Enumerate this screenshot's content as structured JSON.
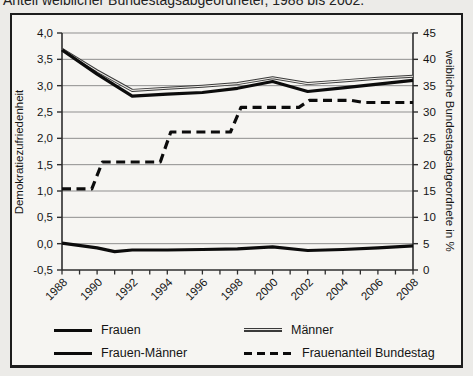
{
  "page": {
    "title": "Anteil weiblicher Bundestagsabgeordneter, 1988 bis 2002."
  },
  "chart_data": {
    "type": "line",
    "title": "Anteil weiblicher Bundestagsabgeordneter, 1988 bis 2002.",
    "grid": true,
    "legend_position": "bottom",
    "left_axis": {
      "label": "Demokratiezufriedenheit",
      "min": -0.5,
      "max": 4.0,
      "step": 0.5,
      "tick_labels": [
        "4,0",
        "3,5",
        "3,0",
        "2,5",
        "2,0",
        "1,5",
        "1,0",
        "0,5",
        "0,0",
        "-0,5"
      ]
    },
    "right_axis": {
      "label": "weibliche Bundestagsabgeordnete in %",
      "min": 0,
      "max": 45,
      "step": 5,
      "tick_labels": [
        "45",
        "40",
        "35",
        "30",
        "25",
        "20",
        "15",
        "10",
        "5",
        "0"
      ]
    },
    "x_axis": {
      "min": 1988,
      "max": 2008,
      "tick_every": 1,
      "label_every": 2,
      "tick_labels": [
        "1988",
        "1990",
        "1992",
        "1994",
        "1996",
        "1998",
        "2000",
        "2002",
        "2004",
        "2006",
        "2008"
      ]
    },
    "series": [
      {
        "id": "maenner",
        "name": "Männer",
        "axis": "left",
        "style": {
          "color": "#3a3a3a",
          "width": 3,
          "dash": null,
          "double": true,
          "core_color": "#eceae6"
        },
        "points": [
          [
            1988,
            3.69
          ],
          [
            1990,
            3.28
          ],
          [
            1992,
            2.91
          ],
          [
            1994,
            2.95
          ],
          [
            1996,
            2.99
          ],
          [
            1998,
            3.04
          ],
          [
            2000,
            3.15
          ],
          [
            2002,
            3.04
          ],
          [
            2004,
            3.09
          ],
          [
            2006,
            3.14
          ],
          [
            2008,
            3.18
          ]
        ]
      },
      {
        "id": "frauen",
        "name": "Frauen",
        "axis": "left",
        "style": {
          "color": "#0c0c0c",
          "width": 3.2,
          "dash": null
        },
        "points": [
          [
            1988,
            3.68
          ],
          [
            1990,
            3.22
          ],
          [
            1992,
            2.8
          ],
          [
            1994,
            2.84
          ],
          [
            1996,
            2.87
          ],
          [
            1998,
            2.95
          ],
          [
            2000,
            3.08
          ],
          [
            2002,
            2.89
          ],
          [
            2004,
            2.96
          ],
          [
            2006,
            3.03
          ],
          [
            2008,
            3.1
          ]
        ]
      },
      {
        "id": "frauen_maenner",
        "name": "Frauen-Männer",
        "axis": "left",
        "style": {
          "color": "#0c0c0c",
          "width": 3.2,
          "dash": null
        },
        "points": [
          [
            1988,
            0.01
          ],
          [
            1990,
            -0.08
          ],
          [
            1991,
            -0.15
          ],
          [
            1992,
            -0.12
          ],
          [
            1994,
            -0.12
          ],
          [
            1996,
            -0.11
          ],
          [
            1998,
            -0.1
          ],
          [
            2000,
            -0.06
          ],
          [
            2002,
            -0.13
          ],
          [
            2004,
            -0.11
          ],
          [
            2006,
            -0.08
          ],
          [
            2008,
            -0.04
          ]
        ]
      },
      {
        "id": "frauenanteil",
        "name": "Frauenanteil Bundestag",
        "axis": "right",
        "style": {
          "color": "#0c0c0c",
          "width": 3.2,
          "dash": "9,5.5"
        },
        "points": [
          [
            1988,
            15.4
          ],
          [
            1989.7,
            15.4
          ],
          [
            1990.3,
            20.5
          ],
          [
            1993.6,
            20.5
          ],
          [
            1994.2,
            26.2
          ],
          [
            1997.6,
            26.2
          ],
          [
            1998.2,
            30.9
          ],
          [
            2001.5,
            30.9
          ],
          [
            2002.1,
            32.2
          ],
          [
            2004.5,
            32.2
          ],
          [
            2005.2,
            31.8
          ],
          [
            2008,
            31.8
          ]
        ]
      }
    ],
    "colors": {
      "grid": "#8f8f8f",
      "axis": "#2e2e2e",
      "text": "#141414"
    }
  },
  "legend": {
    "items": [
      {
        "label": "Frauen",
        "key": "solid-black"
      },
      {
        "label": "Männer",
        "key": "solid-gray"
      },
      {
        "label": "Frauen-Männer",
        "key": "solid-black"
      },
      {
        "label": "Frauenanteil Bundestag",
        "key": "dashed-black"
      }
    ]
  }
}
